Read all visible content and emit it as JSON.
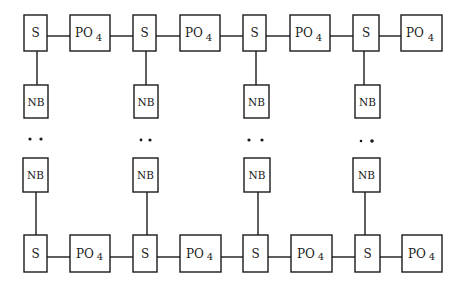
{
  "diagram": {
    "type": "nucleic-acid-double-strand-schematic",
    "colors": {
      "stroke": "#1a1a1a",
      "background": "#ffffff"
    },
    "labels": {
      "sugar": "S",
      "phosphate_base": "PO",
      "phosphate_sub": "4",
      "base": "NB",
      "pairing": "• •"
    },
    "top_strand": [
      {
        "kind": "sugar",
        "label": "S"
      },
      {
        "kind": "phosphate",
        "label": "PO4"
      },
      {
        "kind": "sugar",
        "label": "S"
      },
      {
        "kind": "phosphate",
        "label": "PO4"
      },
      {
        "kind": "sugar",
        "label": "S"
      },
      {
        "kind": "phosphate",
        "label": "PO4"
      },
      {
        "kind": "sugar",
        "label": "S"
      },
      {
        "kind": "phosphate",
        "label": "PO4"
      }
    ],
    "bottom_strand": [
      {
        "kind": "sugar",
        "label": "S"
      },
      {
        "kind": "phosphate",
        "label": "PO4"
      },
      {
        "kind": "sugar",
        "label": "S"
      },
      {
        "kind": "phosphate",
        "label": "PO4"
      },
      {
        "kind": "sugar",
        "label": "S"
      },
      {
        "kind": "phosphate",
        "label": "PO4"
      },
      {
        "kind": "sugar",
        "label": "S"
      },
      {
        "kind": "phosphate",
        "label": "PO4"
      }
    ],
    "base_pairs": [
      {
        "top": "NB",
        "bottom": "NB",
        "bond": "• •"
      },
      {
        "top": "NB",
        "bottom": "NB",
        "bond": "• •"
      },
      {
        "top": "NB",
        "bottom": "NB",
        "bond": "• •"
      },
      {
        "top": "NB",
        "bottom": "NB",
        "bond": "• •"
      }
    ]
  }
}
